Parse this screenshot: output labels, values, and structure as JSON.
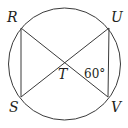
{
  "diagram": {
    "type": "circle-geometry",
    "stroke_color": "#3a3a3a",
    "circle": {
      "cx": 64.5,
      "cy": 64,
      "r": 56
    },
    "points": {
      "R": {
        "x": 21,
        "y": 28,
        "label": "R",
        "label_x": 7,
        "label_y": 22
      },
      "U": {
        "x": 109,
        "y": 28,
        "label": "U",
        "label_x": 111,
        "label_y": 22
      },
      "S": {
        "x": 21,
        "y": 97,
        "label": "S",
        "label_x": 9,
        "label_y": 112
      },
      "V": {
        "x": 108,
        "y": 97,
        "label": "V",
        "label_x": 111,
        "label_y": 112
      },
      "T": {
        "x": 64,
        "y": 62,
        "label": "T",
        "label_x": 58,
        "label_y": 79
      }
    },
    "segments": [
      {
        "from": "R",
        "to": "V"
      },
      {
        "from": "U",
        "to": "S"
      },
      {
        "from": "R",
        "to": "S"
      },
      {
        "from": "U",
        "to": "V"
      }
    ],
    "angle_label": {
      "text": "60°",
      "x": 84,
      "y": 78
    }
  }
}
